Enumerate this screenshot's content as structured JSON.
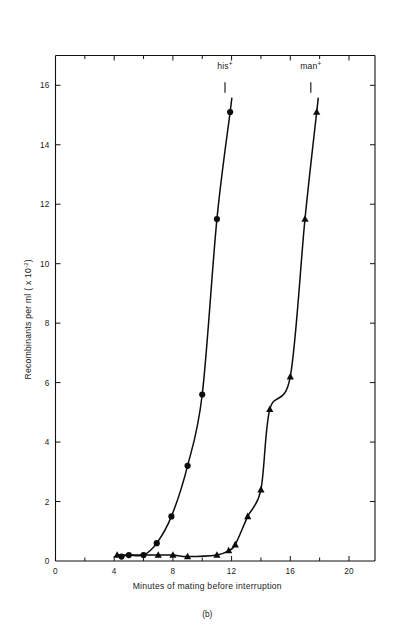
{
  "figure": {
    "caption": "(b)",
    "background": "#ffffff",
    "ink_color": "#0d0d0d"
  },
  "chart_data": {
    "type": "scatter",
    "title": "",
    "subtitle": "",
    "xlabel": "Minutes of mating before interruption",
    "ylabel": "Recombinants per ml ( x 10",
    "ylabel_exponent": "-2",
    "ylabel_suffix": ")",
    "xlim": [
      0,
      21.5
    ],
    "ylim": [
      0,
      16.8
    ],
    "xticks": [
      0,
      4,
      8,
      12,
      16,
      20
    ],
    "xticklabels": [
      "0",
      "4",
      "8",
      "12",
      "16",
      "20"
    ],
    "xminorticks": [
      2,
      6,
      10,
      14,
      18
    ],
    "yticks": [
      0,
      2,
      4,
      6,
      8,
      10,
      12,
      14,
      16
    ],
    "yticklabels": [
      "0",
      "2",
      "4",
      "6",
      "8",
      "10",
      "12",
      "14",
      "16"
    ],
    "grid": false,
    "legend_position": "inline-above-curves",
    "series": [
      {
        "name": "his+",
        "label_base": "his",
        "label_sup": "+",
        "marker": "circle",
        "label_x": 11.55,
        "label_y": 16.55,
        "leader_x1": 11.55,
        "leader_y1": 16.1,
        "leader_x2": 11.55,
        "leader_y2": 15.75,
        "x": [
          4.5,
          5.0,
          6.0,
          6.9,
          7.9,
          9.0,
          10.0,
          11.0,
          11.9
        ],
        "y": [
          0.15,
          0.2,
          0.2,
          0.6,
          1.5,
          3.2,
          5.6,
          11.5,
          15.1
        ]
      },
      {
        "name": "man+",
        "label_base": "man",
        "label_sup": "+",
        "marker": "triangle",
        "label_x": 17.4,
        "label_y": 16.55,
        "leader_x1": 17.4,
        "leader_y1": 16.1,
        "leader_x2": 17.4,
        "leader_y2": 15.75,
        "x": [
          4.2,
          7.0,
          8.0,
          9.0,
          11.0,
          11.8,
          12.25,
          13.1,
          14.0,
          14.6,
          16.0,
          17.0,
          17.8
        ],
        "y": [
          0.2,
          0.2,
          0.2,
          0.15,
          0.2,
          0.35,
          0.55,
          1.5,
          2.4,
          5.1,
          6.2,
          11.5,
          15.1
        ]
      }
    ]
  }
}
